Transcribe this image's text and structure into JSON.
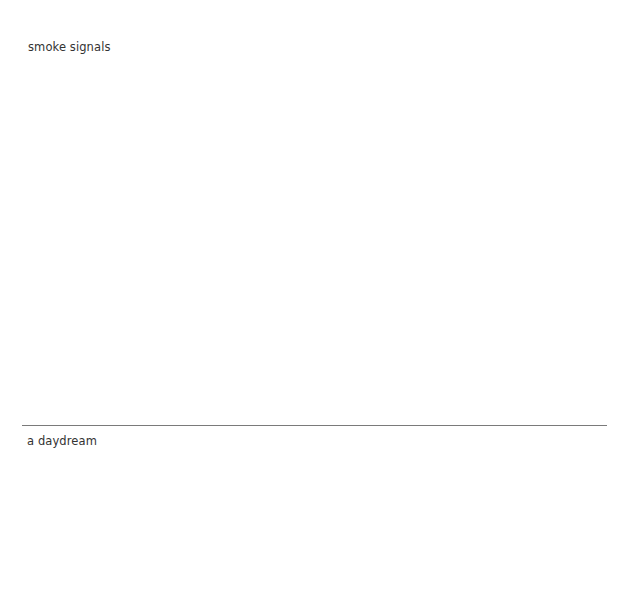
{
  "sections": [
    {
      "title": "smoke signals"
    },
    {
      "title": "a daydream"
    }
  ],
  "colors": {
    "background": "#ffffff",
    "text": "#333333",
    "divider": "#7a7a7a"
  }
}
